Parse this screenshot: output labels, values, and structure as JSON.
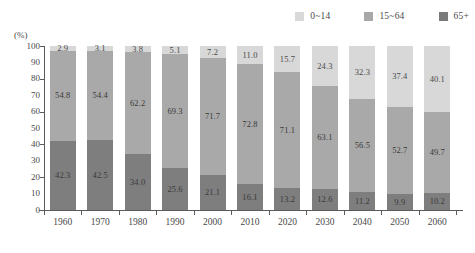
{
  "chart": {
    "unit_label": "(%)",
    "y_axis": {
      "min": 0,
      "max": 100,
      "tick_labels": [
        "100",
        "90",
        "80",
        "70",
        "60",
        "50",
        "40",
        "30",
        "20",
        "10",
        "0"
      ],
      "tick_values": [
        100,
        90,
        80,
        70,
        60,
        50,
        40,
        30,
        20,
        10,
        0
      ],
      "major_ticks": [
        100,
        80,
        60,
        40,
        20,
        0
      ]
    },
    "legend": [
      {
        "label": "0~14",
        "color": "#d9d9d9",
        "name": "legend-item-0-14"
      },
      {
        "label": "15~64",
        "color": "#a8a8a8",
        "name": "legend-item-15-64"
      },
      {
        "label": "65+",
        "color": "#7a7a7a",
        "name": "legend-item-65-plus"
      }
    ],
    "colors": {
      "young": "#7e7e7e",
      "working": "#a9a9a9",
      "old": "#d8d8d8",
      "axis": "#5a5a5a",
      "text": "#4a4a4a"
    }
  },
  "chart_data": {
    "type": "bar",
    "subtype": "stacked-100-percent",
    "title": "",
    "xlabel": "",
    "ylabel": "(%)",
    "ylim": [
      0,
      100
    ],
    "grid": false,
    "legend_position": "top-right",
    "categories": [
      "1960",
      "1970",
      "1980",
      "1990",
      "2000",
      "2010",
      "2020",
      "2030",
      "2040",
      "2050",
      "2060"
    ],
    "series": [
      {
        "name": "0~14",
        "color": "#7e7e7e",
        "stack_position": "bottom",
        "values": [
          42.3,
          42.5,
          34.0,
          25.6,
          21.1,
          16.1,
          13.2,
          12.6,
          11.2,
          9.9,
          10.2
        ]
      },
      {
        "name": "15~64",
        "color": "#a9a9a9",
        "stack_position": "middle",
        "values": [
          54.8,
          54.4,
          62.2,
          69.3,
          71.7,
          72.8,
          71.1,
          63.1,
          56.5,
          52.7,
          49.7
        ]
      },
      {
        "name": "65+",
        "color": "#d8d8d8",
        "stack_position": "top",
        "values": [
          2.9,
          3.1,
          3.8,
          5.1,
          7.2,
          11.0,
          15.7,
          24.3,
          32.3,
          37.4,
          40.1
        ]
      }
    ]
  }
}
